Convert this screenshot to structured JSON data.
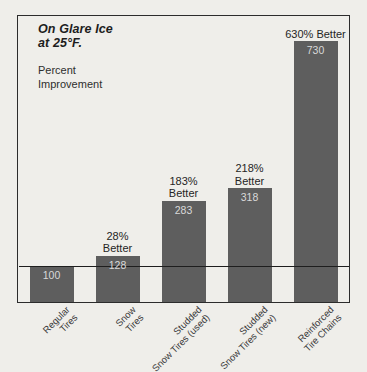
{
  "chart_data": {
    "type": "bar",
    "title": "On Glare Ice at 25°F.",
    "title_line1": "On Glare Ice",
    "title_line2": "at 25°F.",
    "subtitle_line1": "Percent",
    "subtitle_line2": "Improvement",
    "xlabel": "",
    "ylabel": "Percent Improvement",
    "ylim": [
      0,
      800
    ],
    "grid": false,
    "legend": "none",
    "baseline_value": 100,
    "categories": [
      "Regular Tires",
      "Snow Tires",
      "Studded Snow Tires (used)",
      "Studded Snow Tires (new)",
      "Reinforced Tire Chains"
    ],
    "values": [
      100,
      128,
      283,
      318,
      730
    ],
    "annotations": [
      "",
      "28% Better",
      "183% Better",
      "218% Better",
      "630% Better"
    ],
    "bars": [
      {
        "category": "Regular Tires",
        "label_line1": "Regular",
        "label_line2": "Tires",
        "value": 100,
        "value_text": "100",
        "annotation_line1": "",
        "annotation_line2": "",
        "percent_better": 0
      },
      {
        "category": "Snow Tires",
        "label_line1": "Snow",
        "label_line2": "Tires",
        "value": 128,
        "value_text": "128",
        "annotation_line1": "28%",
        "annotation_line2": "Better",
        "percent_better": 28
      },
      {
        "category": "Studded Snow Tires (used)",
        "label_line1": "Studded",
        "label_line2": "Snow Tires (used)",
        "value": 283,
        "value_text": "283",
        "annotation_line1": "183%",
        "annotation_line2": "Better",
        "percent_better": 183
      },
      {
        "category": "Studded Snow Tires (new)",
        "label_line1": "Studded",
        "label_line2": "Snow Tires (new)",
        "value": 318,
        "value_text": "318",
        "annotation_line1": "218%",
        "annotation_line2": "Better",
        "percent_better": 218
      },
      {
        "category": "Reinforced Tire Chains",
        "label_line1": "Reinforced",
        "label_line2": "Tire Chains",
        "value": 730,
        "value_text": "730",
        "annotation_line1": "630% Better",
        "annotation_line2": "",
        "percent_better": 630
      }
    ],
    "colors": {
      "bar": "#5e5e5e",
      "background": "#efeeea",
      "frame": "#2c2c2c",
      "baseline": "#1e1e1e",
      "value_text": "#d9d9d9",
      "annotation_text": "#252525",
      "category_text": "#3a3a3a"
    }
  }
}
